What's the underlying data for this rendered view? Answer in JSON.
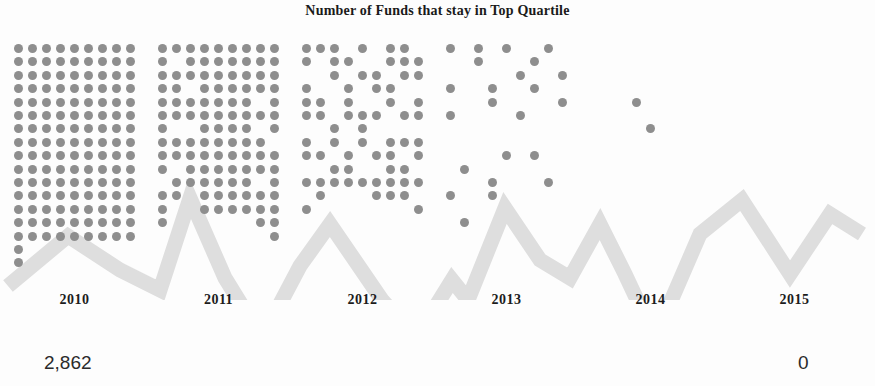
{
  "chart": {
    "title": "Number of Funds that stay in Top Quartile"
  },
  "values": {
    "start_label": "2,862",
    "end_label": "0"
  },
  "colors": {
    "dot": "#8e8e8e",
    "zigzag": "#dedede",
    "background": "#fdfdfd",
    "text": "#1c1c1c"
  },
  "chart_data": {
    "type": "bar",
    "title": "Number of Funds that stay in Top Quartile",
    "xlabel": "",
    "ylabel": "Number of Funds",
    "categories": [
      "2010",
      "2011",
      "2012",
      "2013",
      "2014",
      "2015"
    ],
    "values": [
      2862,
      2362,
      1289,
      332,
      39,
      0
    ],
    "unit_note": "each dot represents a group of funds; dot count scales with the value",
    "grid": false,
    "legend": false,
    "annotations": [
      {
        "text": "2,862",
        "at": "2010",
        "position": "below-left"
      },
      {
        "text": "0",
        "at": "2015",
        "position": "below-right"
      }
    ],
    "panels": [
      {
        "year": "2010",
        "value": 2862,
        "dot_count": 147,
        "columns": 9,
        "rows": 17,
        "missing_cells": [
          [
            15,
            1
          ],
          [
            15,
            2
          ],
          [
            15,
            3
          ],
          [
            15,
            4
          ],
          [
            15,
            5
          ],
          [
            15,
            6
          ],
          [
            15,
            7
          ],
          [
            15,
            8
          ],
          [
            16,
            1
          ],
          [
            16,
            2
          ],
          [
            16,
            3
          ],
          [
            16,
            4
          ],
          [
            16,
            5
          ],
          [
            16,
            6
          ],
          [
            16,
            7
          ],
          [
            16,
            8
          ]
        ]
      },
      {
        "year": "2011",
        "value": 2362,
        "dot_count": 122,
        "columns": 9,
        "rows": 17,
        "missing_cells": [
          [
            1,
            1
          ],
          [
            3,
            2
          ],
          [
            4,
            7
          ],
          [
            6,
            1
          ],
          [
            6,
            2
          ],
          [
            6,
            7
          ],
          [
            7,
            8
          ],
          [
            9,
            1
          ],
          [
            10,
            0
          ],
          [
            10,
            7
          ],
          [
            11,
            2
          ],
          [
            12,
            1
          ],
          [
            12,
            2
          ],
          [
            13,
            1
          ],
          [
            13,
            2
          ],
          [
            13,
            3
          ],
          [
            13,
            4
          ],
          [
            13,
            5
          ],
          [
            13,
            6
          ],
          [
            14,
            0
          ],
          [
            14,
            1
          ],
          [
            14,
            2
          ],
          [
            14,
            3
          ],
          [
            14,
            4
          ],
          [
            14,
            5
          ],
          [
            14,
            6
          ],
          [
            14,
            7
          ],
          [
            15,
            0
          ],
          [
            15,
            1
          ],
          [
            15,
            2
          ],
          [
            15,
            3
          ],
          [
            15,
            4
          ],
          [
            15,
            5
          ],
          [
            15,
            6
          ],
          [
            15,
            7
          ],
          [
            15,
            8
          ],
          [
            16,
            0
          ],
          [
            16,
            1
          ],
          [
            16,
            2
          ],
          [
            16,
            3
          ],
          [
            16,
            4
          ],
          [
            16,
            5
          ],
          [
            16,
            6
          ],
          [
            16,
            7
          ],
          [
            16,
            8
          ]
        ]
      },
      {
        "year": "2012",
        "value": 1289,
        "dot_count": 66,
        "columns": 9,
        "rows": 17,
        "present_cells": [
          [
            0,
            0
          ],
          [
            0,
            1
          ],
          [
            0,
            2
          ],
          [
            0,
            4
          ],
          [
            0,
            6
          ],
          [
            0,
            7
          ],
          [
            1,
            0
          ],
          [
            1,
            2
          ],
          [
            1,
            3
          ],
          [
            1,
            6
          ],
          [
            1,
            7
          ],
          [
            1,
            8
          ],
          [
            2,
            2
          ],
          [
            2,
            4
          ],
          [
            2,
            5
          ],
          [
            2,
            7
          ],
          [
            2,
            8
          ],
          [
            3,
            0
          ],
          [
            3,
            3
          ],
          [
            3,
            5
          ],
          [
            3,
            6
          ],
          [
            4,
            0
          ],
          [
            4,
            1
          ],
          [
            4,
            3
          ],
          [
            4,
            6
          ],
          [
            4,
            8
          ],
          [
            5,
            0
          ],
          [
            5,
            1
          ],
          [
            5,
            3
          ],
          [
            5,
            4
          ],
          [
            5,
            5
          ],
          [
            5,
            7
          ],
          [
            5,
            8
          ],
          [
            6,
            2
          ],
          [
            6,
            4
          ],
          [
            7,
            0
          ],
          [
            7,
            2
          ],
          [
            7,
            4
          ],
          [
            7,
            6
          ],
          [
            7,
            7
          ],
          [
            7,
            8
          ],
          [
            8,
            0
          ],
          [
            8,
            1
          ],
          [
            8,
            3
          ],
          [
            8,
            5
          ],
          [
            8,
            6
          ],
          [
            8,
            8
          ],
          [
            9,
            2
          ],
          [
            9,
            3
          ],
          [
            9,
            6
          ],
          [
            9,
            7
          ],
          [
            10,
            0
          ],
          [
            10,
            1
          ],
          [
            10,
            2
          ],
          [
            10,
            3
          ],
          [
            10,
            4
          ],
          [
            10,
            5
          ],
          [
            10,
            6
          ],
          [
            10,
            7
          ],
          [
            10,
            8
          ],
          [
            11,
            1
          ],
          [
            11,
            5
          ],
          [
            11,
            6
          ],
          [
            11,
            7
          ],
          [
            12,
            0
          ],
          [
            12,
            8
          ]
        ]
      },
      {
        "year": "2013",
        "value": 332,
        "dot_count": 22,
        "columns": 9,
        "rows": 17,
        "present_cells": [
          [
            0,
            0
          ],
          [
            0,
            2
          ],
          [
            0,
            4
          ],
          [
            0,
            7
          ],
          [
            1,
            2
          ],
          [
            1,
            6
          ],
          [
            2,
            5
          ],
          [
            2,
            8
          ],
          [
            3,
            0
          ],
          [
            3,
            3
          ],
          [
            3,
            6
          ],
          [
            4,
            3
          ],
          [
            4,
            8
          ],
          [
            5,
            0
          ],
          [
            5,
            5
          ],
          [
            8,
            4
          ],
          [
            8,
            6
          ],
          [
            9,
            1
          ],
          [
            10,
            3
          ],
          [
            10,
            7
          ],
          [
            11,
            0
          ],
          [
            11,
            3
          ],
          [
            13,
            1
          ]
        ]
      },
      {
        "year": "2014",
        "value": 39,
        "dot_count": 2,
        "columns": 9,
        "rows": 17,
        "present_cells": [
          [
            4,
            3
          ],
          [
            6,
            4
          ]
        ]
      },
      {
        "year": "2015",
        "value": 0,
        "dot_count": 0,
        "columns": 9,
        "rows": 17,
        "present_cells": []
      }
    ]
  }
}
